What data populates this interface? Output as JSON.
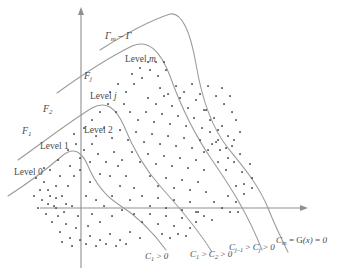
{
  "figure": {
    "background_color": "#ffffff",
    "line_color": "#9a9a9a",
    "axis_color": "#8f8f8f",
    "point_color": "#4a4a4a",
    "text_color": "#4a4a4a"
  },
  "axes": {
    "origin": {
      "x": 81,
      "y": 208
    },
    "x_axis": {
      "from_x": 40,
      "to_x": 303,
      "y": 208,
      "arrow": "right"
    },
    "y_axis": {
      "x": 81,
      "from_y": 268,
      "to_y": 12,
      "arrow": "up"
    }
  },
  "labels": {
    "gamma_region": "Γm – Γ",
    "level_m": "Level m",
    "level_j": "Level j",
    "level_2": "Level 2",
    "level_1": "Level 1",
    "level_0": "Level 0",
    "f_j": "Fj",
    "f_2": "F2",
    "f_1": "F1",
    "curve_c1": "C1 > 0",
    "curve_c1c2": "C1 > C2 > 0",
    "curve_cj": "Cj–1 > Cj > 0",
    "curve_cm": "Cm = G(x) = 0"
  },
  "chart_data": {
    "type": "scatter",
    "title": "",
    "xlabel": "",
    "ylabel": "",
    "grid": false,
    "legend": "none",
    "boundaries": [
      {
        "name": "F1",
        "label": "C1 > 0",
        "path": "M 8,196 C 30,182 48,168 62,156 C 74,146 82,152 88,166 C 94,180 104,195 118,204 C 134,214 150,228 166,250"
      },
      {
        "name": "F2",
        "label": "C1 > C2 > 0",
        "path": "M 18,160 C 46,140 72,120 92,108 C 106,100 116,108 124,126 C 132,146 144,168 160,186 C 176,204 196,226 212,252"
      },
      {
        "name": "Fj",
        "label": "Cj-1 > Cj > 0",
        "path": "M 57,93 C 86,72 112,56 132,46 C 148,39 160,50 170,76 C 180,104 194,134 212,160 C 230,186 248,214 262,250"
      },
      {
        "name": "Fm",
        "label": "Cm = G(x) = 0",
        "path": "M 100,50 C 128,32 152,20 170,14 C 182,12 190,30 196,64 C 202,100 212,128 228,148 C 244,168 258,184 268,208 C 276,228 282,240 288,252"
      }
    ],
    "regions": [
      {
        "label": "Level 0",
        "position": "left of F1"
      },
      {
        "label": "Level 1",
        "position": "between F1 and F2"
      },
      {
        "label": "Level 2",
        "position": "between F2 and Fj"
      },
      {
        "label": "Level j",
        "position": "between Fj and Fm"
      },
      {
        "label": "Level m",
        "position": "right of Fm"
      }
    ],
    "points": [
      [
        68,
        186
      ],
      [
        74,
        176
      ],
      [
        62,
        196
      ],
      [
        80,
        170
      ],
      [
        90,
        182
      ],
      [
        100,
        174
      ],
      [
        86,
        196
      ],
      [
        96,
        200
      ],
      [
        72,
        206
      ],
      [
        64,
        212
      ],
      [
        78,
        216
      ],
      [
        92,
        214
      ],
      [
        104,
        206
      ],
      [
        112,
        196
      ],
      [
        120,
        186
      ],
      [
        110,
        176
      ],
      [
        118,
        166
      ],
      [
        126,
        176
      ],
      [
        134,
        188
      ],
      [
        130,
        200
      ],
      [
        122,
        210
      ],
      [
        112,
        216
      ],
      [
        100,
        222
      ],
      [
        88,
        226
      ],
      [
        76,
        228
      ],
      [
        66,
        224
      ],
      [
        58,
        216
      ],
      [
        54,
        206
      ],
      [
        50,
        196
      ],
      [
        56,
        186
      ],
      [
        60,
        176
      ],
      [
        70,
        166
      ],
      [
        80,
        158
      ],
      [
        90,
        162
      ],
      [
        98,
        154
      ],
      [
        106,
        162
      ],
      [
        114,
        152
      ],
      [
        122,
        160
      ],
      [
        132,
        152
      ],
      [
        140,
        162
      ],
      [
        148,
        154
      ],
      [
        156,
        164
      ],
      [
        164,
        156
      ],
      [
        172,
        166
      ],
      [
        180,
        158
      ],
      [
        188,
        168
      ],
      [
        196,
        160
      ],
      [
        204,
        170
      ],
      [
        150,
        176
      ],
      [
        158,
        186
      ],
      [
        166,
        178
      ],
      [
        174,
        188
      ],
      [
        182,
        180
      ],
      [
        190,
        190
      ],
      [
        198,
        182
      ],
      [
        206,
        192
      ],
      [
        142,
        196
      ],
      [
        150,
        206
      ],
      [
        158,
        198
      ],
      [
        166,
        208
      ],
      [
        174,
        200
      ],
      [
        182,
        210
      ],
      [
        190,
        202
      ],
      [
        198,
        212
      ],
      [
        134,
        214
      ],
      [
        142,
        222
      ],
      [
        150,
        214
      ],
      [
        158,
        224
      ],
      [
        166,
        216
      ],
      [
        174,
        226
      ],
      [
        182,
        218
      ],
      [
        190,
        228
      ],
      [
        96,
        136
      ],
      [
        104,
        128
      ],
      [
        112,
        138
      ],
      [
        120,
        130
      ],
      [
        128,
        140
      ],
      [
        136,
        132
      ],
      [
        144,
        142
      ],
      [
        152,
        134
      ],
      [
        160,
        144
      ],
      [
        168,
        136
      ],
      [
        176,
        146
      ],
      [
        184,
        138
      ],
      [
        192,
        148
      ],
      [
        200,
        140
      ],
      [
        208,
        150
      ],
      [
        216,
        142
      ],
      [
        130,
        112
      ],
      [
        138,
        120
      ],
      [
        146,
        112
      ],
      [
        154,
        122
      ],
      [
        162,
        114
      ],
      [
        170,
        124
      ],
      [
        178,
        116
      ],
      [
        186,
        126
      ],
      [
        194,
        118
      ],
      [
        202,
        128
      ],
      [
        210,
        120
      ],
      [
        218,
        130
      ],
      [
        206,
        110
      ],
      [
        214,
        118
      ],
      [
        222,
        126
      ],
      [
        228,
        136
      ],
      [
        148,
        98
      ],
      [
        156,
        104
      ],
      [
        164,
        96
      ],
      [
        172,
        106
      ],
      [
        180,
        98
      ],
      [
        188,
        108
      ],
      [
        196,
        100
      ],
      [
        204,
        110
      ],
      [
        160,
        88
      ],
      [
        168,
        94
      ],
      [
        176,
        86
      ],
      [
        184,
        92
      ],
      [
        192,
        84
      ],
      [
        200,
        94
      ],
      [
        208,
        86
      ],
      [
        216,
        96
      ],
      [
        224,
        104
      ],
      [
        232,
        112
      ],
      [
        222,
        88
      ],
      [
        230,
        96
      ],
      [
        236,
        120
      ],
      [
        240,
        132
      ],
      [
        232,
        146
      ],
      [
        240,
        154
      ],
      [
        218,
        162
      ],
      [
        226,
        170
      ],
      [
        234,
        162
      ],
      [
        242,
        172
      ],
      [
        250,
        164
      ],
      [
        244,
        184
      ],
      [
        252,
        178
      ],
      [
        236,
        186
      ],
      [
        228,
        196
      ],
      [
        236,
        202
      ],
      [
        244,
        194
      ],
      [
        252,
        188
      ],
      [
        214,
        202
      ],
      [
        222,
        208
      ],
      [
        230,
        212
      ],
      [
        238,
        212
      ],
      [
        58,
        160
      ],
      [
        50,
        170
      ],
      [
        44,
        182
      ],
      [
        48,
        190
      ],
      [
        42,
        200
      ],
      [
        38,
        208
      ],
      [
        46,
        214
      ],
      [
        52,
        222
      ],
      [
        60,
        232
      ],
      [
        70,
        238
      ],
      [
        80,
        240
      ],
      [
        90,
        236
      ],
      [
        100,
        240
      ],
      [
        110,
        234
      ],
      [
        120,
        240
      ],
      [
        130,
        232
      ],
      [
        140,
        238
      ],
      [
        86,
        244
      ],
      [
        96,
        246
      ],
      [
        72,
        246
      ],
      [
        62,
        242
      ],
      [
        106,
        244
      ],
      [
        116,
        246
      ],
      [
        126,
        244
      ],
      [
        84,
        150
      ],
      [
        92,
        144
      ],
      [
        76,
        144
      ],
      [
        68,
        150
      ],
      [
        74,
        134
      ],
      [
        84,
        128
      ],
      [
        92,
        120
      ],
      [
        100,
        112
      ],
      [
        108,
        104
      ],
      [
        116,
        112
      ],
      [
        124,
        104
      ],
      [
        110,
        92
      ],
      [
        118,
        84
      ],
      [
        126,
        92
      ],
      [
        134,
        84
      ],
      [
        142,
        78
      ],
      [
        150,
        70
      ],
      [
        158,
        76
      ],
      [
        166,
        70
      ],
      [
        140,
        68
      ],
      [
        132,
        74
      ],
      [
        148,
        62
      ],
      [
        156,
        62
      ],
      [
        164,
        62
      ],
      [
        44,
        168
      ],
      [
        36,
        178
      ],
      [
        40,
        190
      ],
      [
        34,
        196
      ],
      [
        56,
        198
      ],
      [
        66,
        204
      ],
      [
        56,
        208
      ],
      [
        48,
        204
      ],
      [
        204,
        152
      ],
      [
        212,
        144
      ],
      [
        220,
        150
      ],
      [
        228,
        158
      ],
      [
        210,
        132
      ],
      [
        218,
        140
      ],
      [
        226,
        148
      ],
      [
        234,
        140
      ],
      [
        196,
        212
      ],
      [
        204,
        216
      ],
      [
        212,
        220
      ],
      [
        196,
        222
      ],
      [
        186,
        236
      ],
      [
        178,
        234
      ],
      [
        170,
        238
      ],
      [
        162,
        234
      ]
    ]
  }
}
